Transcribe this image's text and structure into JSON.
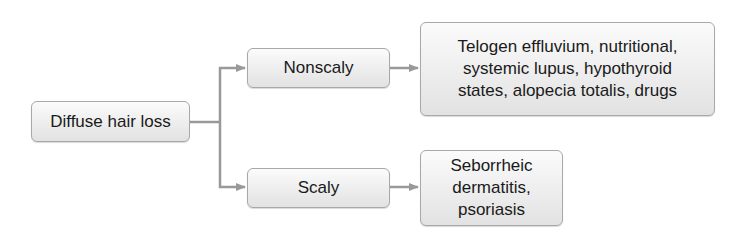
{
  "diagram": {
    "type": "flowchart",
    "edge_color": "#999999",
    "nodes": {
      "root": {
        "label": "Diffuse hair loss"
      },
      "nonscaly": {
        "label": "Nonscaly"
      },
      "scaly": {
        "label": "Scaly"
      },
      "nonscaly_causes": {
        "lines": [
          "Telogen effluvium, nutritional,",
          "systemic lupus, hypothyroid",
          "states, alopecia totalis, drugs"
        ]
      },
      "scaly_causes": {
        "lines": [
          "Seborrheic",
          "dermatitis,",
          "psoriasis"
        ]
      }
    },
    "edges": [
      {
        "from": "root",
        "to": "nonscaly"
      },
      {
        "from": "root",
        "to": "scaly"
      },
      {
        "from": "nonscaly",
        "to": "nonscaly_causes"
      },
      {
        "from": "scaly",
        "to": "scaly_causes"
      }
    ]
  }
}
